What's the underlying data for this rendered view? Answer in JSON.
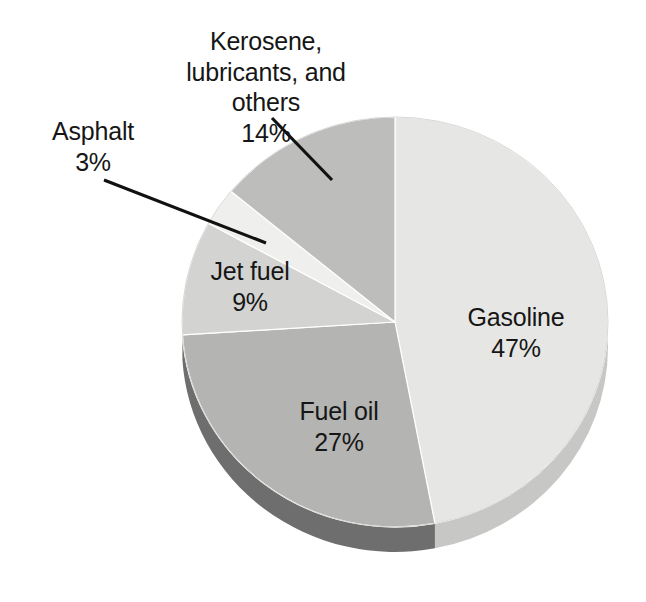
{
  "chart_data": {
    "type": "pie",
    "title": "",
    "subtitle": "",
    "xlabel": "",
    "ylabel": "",
    "legend_position": "none",
    "grid": false,
    "style": "3d-pie",
    "unit": "%",
    "categories": [
      "Gasoline",
      "Fuel oil",
      "Jet fuel",
      "Asphalt",
      "Kerosene, lubricants, and others"
    ],
    "values": [
      47,
      27,
      9,
      3,
      14
    ],
    "slices": [
      {
        "label": "Gasoline",
        "value": 47,
        "value_text": "47%",
        "color": "#e6e6e4",
        "side_color": "#c7c7c5",
        "start_angle": 0,
        "end_angle": 169.2,
        "label_placement": "inside"
      },
      {
        "label": "Fuel oil",
        "value": 27,
        "value_text": "27%",
        "color": "#b4b4b2",
        "side_color": "#6e6e6e",
        "start_angle": 169.2,
        "end_angle": 266.4,
        "label_placement": "inside"
      },
      {
        "label": "Jet fuel",
        "value": 9,
        "value_text": "9%",
        "color": "#d3d3d1",
        "side_color": "#a8a8a6",
        "start_angle": 266.4,
        "end_angle": 298.8,
        "label_placement": "inside"
      },
      {
        "label": "Asphalt",
        "value": 3,
        "value_text": "3%",
        "color": "#efefed",
        "side_color": "#cdcdcb",
        "start_angle": 298.8,
        "end_angle": 309.6,
        "label_placement": "callout"
      },
      {
        "label": "Kerosene, lubricants, and others",
        "value": 14,
        "value_text": "14%",
        "color": "#bdbdbb",
        "side_color": "#9b9b99",
        "start_angle": 309.6,
        "end_angle": 360,
        "label_placement": "callout"
      }
    ]
  },
  "labels": {
    "kerosene": {
      "name": "Kerosene, lubricants, and others",
      "pct": "14%"
    },
    "asphalt": {
      "name": "Asphalt",
      "pct": "3%"
    },
    "jetfuel": {
      "name": "Jet fuel",
      "pct": "9%"
    },
    "gasoline": {
      "name": "Gasoline",
      "pct": "47%"
    },
    "fueloil": {
      "name": "Fuel oil",
      "pct": "27%"
    }
  },
  "colors": {
    "background": "#ffffff",
    "text": "#161616",
    "leader_line": "#111111",
    "gasoline": "#e6e6e4",
    "fuel_oil": "#b4b4b2",
    "jet_fuel": "#d3d3d1",
    "asphalt": "#efefed",
    "kerosene": "#bdbdbb",
    "gasoline_side": "#c7c7c5",
    "fuel_oil_side": "#6e6e6e",
    "jet_fuel_side": "#a8a8a6"
  }
}
